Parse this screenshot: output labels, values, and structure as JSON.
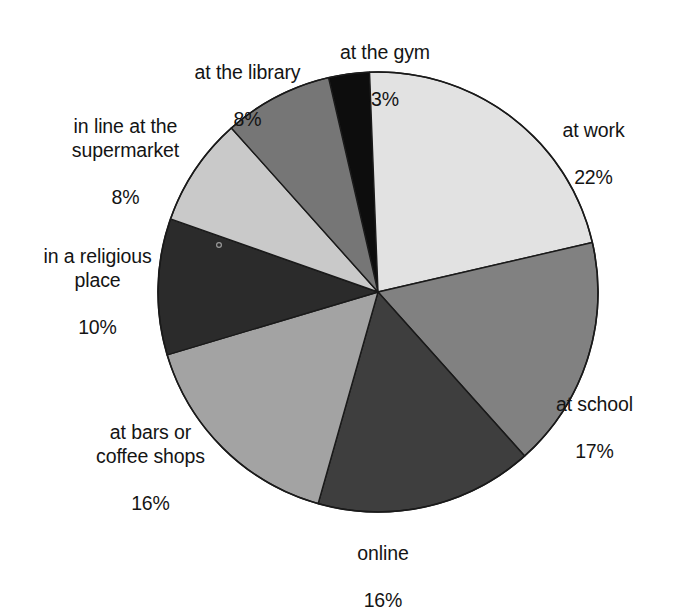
{
  "chart_data": {
    "type": "pie",
    "title": "",
    "subtitle": "",
    "xlabel": "",
    "ylabel": "",
    "legend_position": "none",
    "grid": false,
    "units": "percent",
    "total": 100,
    "start_angle_deg": -13,
    "direction": "clockwise",
    "categories": [
      "at the gym",
      "at work",
      "at school",
      "online",
      "at bars or coffee shops",
      "in a religious place",
      "in line at the supermarket",
      "at the library"
    ],
    "values": [
      3,
      22,
      17,
      16,
      16,
      10,
      8,
      8
    ],
    "labels": [
      "at the gym",
      "at work",
      "at school",
      "online",
      "at bars or\ncoffee shops",
      "in a religious\nplace",
      "in line at the\nsupermarket",
      "at the library"
    ],
    "value_labels": [
      "3%",
      "22%",
      "17%",
      "16%",
      "16%",
      "10%",
      "8%",
      "8%"
    ],
    "colors": [
      "#0d0d0d",
      "#e2e2e2",
      "#818181",
      "#3e3e3e",
      "#a3a3a3",
      "#2b2b2b",
      "#c9c9c9",
      "#767676"
    ],
    "slice_outline_color": "#1a1a1a",
    "background_color": "#ffffff",
    "slices": [
      {
        "name": "at the gym",
        "label": "at the gym",
        "percent": 3,
        "value_label": "3%",
        "color": "#0d0d0d"
      },
      {
        "name": "at work",
        "label": "at work",
        "percent": 22,
        "value_label": "22%",
        "color": "#e2e2e2"
      },
      {
        "name": "at school",
        "label": "at school",
        "percent": 17,
        "value_label": "17%",
        "color": "#818181"
      },
      {
        "name": "online",
        "label": "online",
        "percent": 16,
        "value_label": "16%",
        "color": "#3e3e3e"
      },
      {
        "name": "at bars or coffee shops",
        "label": "at bars or\ncoffee shops",
        "percent": 16,
        "value_label": "16%",
        "color": "#a3a3a3"
      },
      {
        "name": "in a religious place",
        "label": "in a religious\nplace",
        "percent": 10,
        "value_label": "10%",
        "color": "#2b2b2b"
      },
      {
        "name": "in line at the supermarket",
        "label": "in line at the\nsupermarket",
        "percent": 8,
        "value_label": "8%",
        "color": "#c9c9c9"
      },
      {
        "name": "at the library",
        "label": "at the library",
        "percent": 8,
        "value_label": "8%",
        "color": "#767676"
      }
    ],
    "geometry": {
      "center_x": 378,
      "center_y": 292,
      "radius": 220
    }
  }
}
